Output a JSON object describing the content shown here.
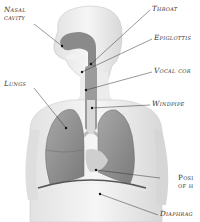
{
  "diagram": {
    "labels": {
      "nasal_cavity_line1": "Nasal",
      "nasal_cavity_line2": "cavity",
      "throat": "Throat",
      "epiglottis": "Epiglottis",
      "vocal_cords": "Vocal cor",
      "lungs": "Lungs",
      "windpipe": "Windpipe",
      "position_line1": "Posi",
      "position_line2": "of h",
      "diaphragm": "Diaphrag"
    },
    "colors": {
      "body": "#ececec",
      "body_outline": "#c8c8c8",
      "airway": "#8a8a8a",
      "lung": "#9a9a9a",
      "lung_dark": "#7d7d7d",
      "leader_line": "#333333"
    }
  }
}
